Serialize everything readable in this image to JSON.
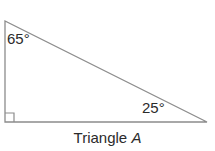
{
  "figure": {
    "type": "right-triangle-diagram",
    "background_color": "#ffffff",
    "stroke_color": "#8c8c8c",
    "text_color": "#2b2b2b",
    "caption": {
      "prefix": "Triangle ",
      "name": "A",
      "full": "Triangle A"
    },
    "angles": [
      {
        "id": "top-left",
        "label": "65°",
        "value": 65,
        "unit": "degrees",
        "vertex": [
          5,
          21
        ]
      },
      {
        "id": "bottom-right",
        "label": "25°",
        "value": 25,
        "unit": "degrees",
        "vertex": [
          207,
          122
        ]
      },
      {
        "id": "bottom-left",
        "label": "",
        "value": 90,
        "unit": "degrees",
        "vertex": [
          5,
          122
        ],
        "marker": "right-angle-square"
      }
    ],
    "vertices": {
      "top_left": [
        5,
        21
      ],
      "bottom_left": [
        5,
        122
      ],
      "bottom_right": [
        207,
        122
      ]
    },
    "right_angle_marker": {
      "size": 9,
      "x": 5,
      "y": 113
    }
  }
}
